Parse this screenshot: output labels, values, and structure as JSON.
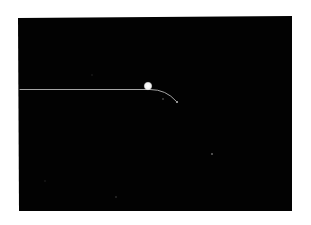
{
  "image": {
    "description": "Dark photographic plate showing a single bright particle track with a bright spot and a downward curving tail",
    "background_color": "#ffffff",
    "plate_color": "#020202",
    "track_color": "#d8d8d8",
    "spot_color": "#f4f4f4",
    "bright_spot": {
      "cx": 148,
      "cy": 86,
      "r": 3.8
    },
    "track": {
      "start": [
        20,
        89.5
      ],
      "straight_end": [
        150,
        89.5
      ],
      "curve_ctrl": [
        166,
        89.5
      ],
      "curve_end": [
        176,
        101
      ]
    },
    "small_marks": [
      {
        "cx": 163,
        "cy": 99,
        "r": 0.7,
        "opacity": 0.6
      },
      {
        "cx": 177,
        "cy": 102,
        "r": 1.1,
        "opacity": 0.8
      },
      {
        "cx": 212,
        "cy": 154,
        "r": 1.0,
        "opacity": 0.45
      },
      {
        "cx": 116,
        "cy": 197,
        "r": 0.8,
        "opacity": 0.3
      },
      {
        "cx": 92,
        "cy": 75,
        "r": 0.7,
        "opacity": 0.2
      },
      {
        "cx": 45,
        "cy": 181,
        "r": 0.7,
        "opacity": 0.2
      }
    ]
  }
}
